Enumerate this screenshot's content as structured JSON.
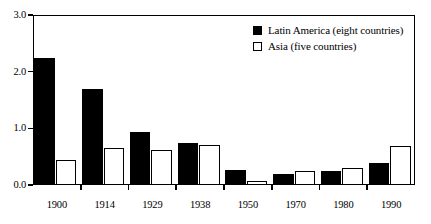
{
  "chart_data": {
    "type": "bar",
    "title": "",
    "subtitle": "",
    "xlabel": "",
    "ylabel": "",
    "categories": [
      "1900",
      "1914",
      "1929",
      "1938",
      "1950",
      "1970",
      "1980",
      "1990"
    ],
    "series": [
      {
        "name": "Latin America (eight countries)",
        "color": "#000000",
        "fill": "solid",
        "values": [
          2.25,
          1.7,
          0.93,
          0.74,
          0.26,
          0.2,
          0.24,
          0.39
        ]
      },
      {
        "name": "Asia (five countries)",
        "color": "#ffffff",
        "fill": "hollow",
        "values": [
          0.44,
          0.66,
          0.61,
          0.7,
          0.07,
          0.25,
          0.3,
          0.68
        ]
      }
    ],
    "ylim": [
      0.0,
      3.0
    ],
    "ytick_labels": [
      "0.0",
      "1.0",
      "2.0",
      "3.0"
    ],
    "ytick_values": [
      0.0,
      1.0,
      2.0,
      3.0
    ],
    "grid": false,
    "legend_position": "top-right",
    "annotations": []
  },
  "legend": {
    "items": [
      {
        "label": "Latin America (eight countries)",
        "swatch": "filled-square-icon"
      },
      {
        "label": "Asia (five countries)",
        "swatch": "hollow-square-icon"
      }
    ]
  }
}
